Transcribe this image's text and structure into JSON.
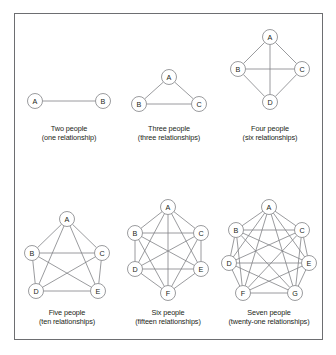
{
  "figure": {
    "border_color": "#6d6e71",
    "background": "#ffffff",
    "node_stroke": "#808285",
    "edge_stroke": "#808285",
    "label_color": "#231f20"
  },
  "panels": [
    {
      "id": "two-people",
      "caption_line1": "Two people",
      "caption_line2": "(one relationship)",
      "people_count": 2,
      "relationship_count": 1,
      "relationship_word": "one",
      "people_word": "Two",
      "layout": "line",
      "width": 96,
      "height": 62,
      "nodes": [
        {
          "label": "A",
          "x": 14,
          "y": 42
        },
        {
          "label": "B",
          "x": 82,
          "y": 42
        }
      ],
      "edges": [
        [
          0,
          1
        ]
      ]
    },
    {
      "id": "three-people",
      "caption_line1": "Three people",
      "caption_line2": "(three relationships)",
      "people_count": 3,
      "relationship_count": 3,
      "relationship_word": "three",
      "people_word": "Three",
      "layout": "triangle",
      "width": 96,
      "height": 62,
      "nodes": [
        {
          "label": "A",
          "x": 48,
          "y": 18
        },
        {
          "label": "B",
          "x": 18,
          "y": 45
        },
        {
          "label": "C",
          "x": 78,
          "y": 45
        }
      ],
      "edges": [
        [
          0,
          1
        ],
        [
          0,
          2
        ],
        [
          1,
          2
        ]
      ]
    },
    {
      "id": "four-people",
      "caption_line1": "Four people",
      "caption_line2": "(six relationships)",
      "people_count": 4,
      "relationship_count": 6,
      "relationship_word": "six",
      "people_word": "Four",
      "layout": "diamond",
      "width": 96,
      "height": 97,
      "nodes": [
        {
          "label": "A",
          "x": 48,
          "y": 13
        },
        {
          "label": "B",
          "x": 16,
          "y": 45
        },
        {
          "label": "C",
          "x": 80,
          "y": 45
        },
        {
          "label": "D",
          "x": 48,
          "y": 78
        }
      ],
      "edges": [
        [
          0,
          1
        ],
        [
          0,
          2
        ],
        [
          0,
          3
        ],
        [
          1,
          2
        ],
        [
          1,
          3
        ],
        [
          2,
          3
        ]
      ]
    },
    {
      "id": "five-people",
      "caption_line1": "Five people",
      "caption_line2": "(ten relationships)",
      "people_count": 5,
      "relationship_count": 10,
      "relationship_word": "ten",
      "people_word": "Five",
      "layout": "pentagon",
      "width": 96,
      "height": 100,
      "nodes": [
        {
          "label": "A",
          "x": 48,
          "y": 14
        },
        {
          "label": "B",
          "x": 13,
          "y": 48
        },
        {
          "label": "C",
          "x": 83,
          "y": 48
        },
        {
          "label": "D",
          "x": 17,
          "y": 86
        },
        {
          "label": "E",
          "x": 79,
          "y": 86
        }
      ],
      "edges": [
        [
          0,
          1
        ],
        [
          0,
          2
        ],
        [
          0,
          3
        ],
        [
          0,
          4
        ],
        [
          1,
          2
        ],
        [
          1,
          3
        ],
        [
          1,
          4
        ],
        [
          2,
          3
        ],
        [
          2,
          4
        ],
        [
          3,
          4
        ]
      ]
    },
    {
      "id": "six-people",
      "caption_line1": "Six people",
      "caption_line2": "(fifteen relationships)",
      "people_count": 6,
      "relationship_count": 15,
      "relationship_word": "fifteen",
      "people_word": "Six",
      "layout": "hexagon",
      "width": 96,
      "height": 110,
      "nodes": [
        {
          "label": "A",
          "x": 48,
          "y": 12
        },
        {
          "label": "B",
          "x": 15,
          "y": 38
        },
        {
          "label": "C",
          "x": 81,
          "y": 38
        },
        {
          "label": "D",
          "x": 15,
          "y": 74
        },
        {
          "label": "E",
          "x": 81,
          "y": 74
        },
        {
          "label": "F",
          "x": 48,
          "y": 98
        }
      ],
      "edges": [
        [
          0,
          1
        ],
        [
          0,
          2
        ],
        [
          0,
          3
        ],
        [
          0,
          4
        ],
        [
          0,
          5
        ],
        [
          1,
          2
        ],
        [
          1,
          3
        ],
        [
          1,
          4
        ],
        [
          1,
          5
        ],
        [
          2,
          3
        ],
        [
          2,
          4
        ],
        [
          2,
          5
        ],
        [
          3,
          4
        ],
        [
          3,
          5
        ],
        [
          4,
          5
        ]
      ]
    },
    {
      "id": "seven-people",
      "caption_line1": "Seven people",
      "caption_line2": "(twenty-one relationships)",
      "people_count": 7,
      "relationship_count": 21,
      "relationship_word": "twenty-one",
      "people_word": "Seven",
      "layout": "heptagon",
      "width": 100,
      "height": 110,
      "nodes": [
        {
          "label": "A",
          "x": 50,
          "y": 12
        },
        {
          "label": "B",
          "x": 17,
          "y": 35
        },
        {
          "label": "C",
          "x": 83,
          "y": 35
        },
        {
          "label": "D",
          "x": 10,
          "y": 68
        },
        {
          "label": "E",
          "x": 90,
          "y": 68
        },
        {
          "label": "F",
          "x": 24,
          "y": 98
        },
        {
          "label": "G",
          "x": 76,
          "y": 98
        }
      ],
      "edges": [
        [
          0,
          1
        ],
        [
          0,
          2
        ],
        [
          0,
          3
        ],
        [
          0,
          4
        ],
        [
          0,
          5
        ],
        [
          0,
          6
        ],
        [
          1,
          2
        ],
        [
          1,
          3
        ],
        [
          1,
          4
        ],
        [
          1,
          5
        ],
        [
          1,
          6
        ],
        [
          2,
          3
        ],
        [
          2,
          4
        ],
        [
          2,
          5
        ],
        [
          2,
          6
        ],
        [
          3,
          4
        ],
        [
          3,
          5
        ],
        [
          3,
          6
        ],
        [
          4,
          5
        ],
        [
          4,
          6
        ],
        [
          5,
          6
        ]
      ]
    }
  ],
  "layout_positions": [
    {
      "left": 4,
      "top": 6,
      "width": 100,
      "height": 122
    },
    {
      "left": 104,
      "top": 6,
      "width": 100,
      "height": 122
    },
    {
      "left": 204,
      "top": 6,
      "width": 102,
      "height": 122
    },
    {
      "left": 2,
      "top": 152,
      "width": 100,
      "height": 160
    },
    {
      "left": 102,
      "top": 152,
      "width": 102,
      "height": 160
    },
    {
      "left": 200,
      "top": 152,
      "width": 108,
      "height": 160
    }
  ],
  "node_radius": 7.5
}
